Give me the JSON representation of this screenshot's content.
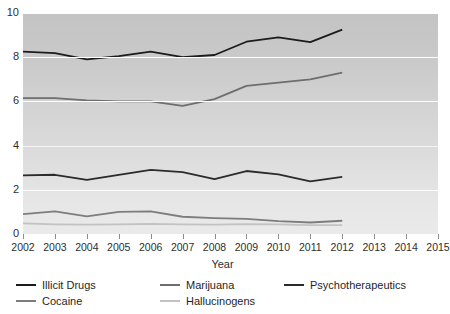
{
  "chart_data": {
    "type": "line",
    "title": "",
    "xlabel": "Year",
    "ylabel": "",
    "grid": true,
    "legend_position": "bottom-left",
    "x": [
      2002,
      2003,
      2004,
      2005,
      2006,
      2007,
      2008,
      2009,
      2010,
      2011,
      2012
    ],
    "xlim": [
      2002,
      2015
    ],
    "ylim": [
      0,
      10
    ],
    "xtick_labels": [
      "2002",
      "2003",
      "2004",
      "2005",
      "2006",
      "2007",
      "2008",
      "2009",
      "2010",
      "2011",
      "2012",
      "2013",
      "2014",
      "2015"
    ],
    "ytick_labels": [
      "0",
      "2",
      "4",
      "6",
      "8",
      "10"
    ],
    "ytick_values": [
      0,
      2,
      4,
      6,
      8,
      10
    ],
    "series": [
      {
        "name": "Illicit Drugs",
        "color": "#1c1c1c",
        "values": [
          8.25,
          8.18,
          7.9,
          8.05,
          8.25,
          8.0,
          8.1,
          8.7,
          8.9,
          8.68,
          9.25
        ]
      },
      {
        "name": "Marijuana",
        "color": "#6e6e6e",
        "values": [
          6.15,
          6.15,
          6.05,
          6.0,
          6.0,
          5.8,
          6.1,
          6.7,
          6.85,
          7.0,
          7.3
        ]
      },
      {
        "name": "Psychotherapeutics",
        "color": "#2b2b2b",
        "values": [
          2.65,
          2.68,
          2.45,
          2.68,
          2.9,
          2.8,
          2.48,
          2.85,
          2.7,
          2.38,
          2.58
        ]
      },
      {
        "name": "Cocaine",
        "color": "#7d7d7d",
        "values": [
          0.9,
          1.02,
          0.8,
          1.0,
          1.02,
          0.78,
          0.72,
          0.68,
          0.58,
          0.52,
          0.6
        ]
      },
      {
        "name": "Hallucinogens",
        "color": "#c2c2c2",
        "values": [
          0.48,
          0.44,
          0.42,
          0.44,
          0.46,
          0.44,
          0.42,
          0.45,
          0.44,
          0.4,
          0.4
        ]
      }
    ]
  },
  "axes": {
    "x_title": "Year"
  }
}
